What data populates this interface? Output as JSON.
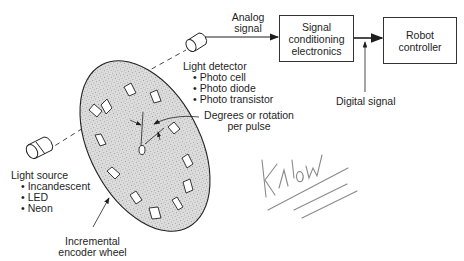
{
  "diagram": {
    "type": "block-diagram",
    "labels": {
      "analog_signal": [
        "Analog",
        "signal"
      ],
      "signal_box": [
        "Signal",
        "conditioning",
        "electronics"
      ],
      "robot_box": [
        "Robot",
        "controller"
      ],
      "digital_signal": "Digital signal",
      "light_detector": {
        "title": "Light detector",
        "items": [
          "Photo cell",
          "Photo diode",
          "Photo transistor"
        ]
      },
      "degrees": [
        "Degrees or rotation",
        "per pulse"
      ],
      "light_source": {
        "title": "Light source",
        "items": [
          "Incandescent",
          "LED",
          "Neon"
        ]
      },
      "wheel": [
        "Incremental",
        "encoder wheel"
      ],
      "handwriting": "Know"
    },
    "colors": {
      "ink": "#1e1e1e",
      "wheel_fill": "#d8d8d8",
      "pencil": "#8a8a8a"
    }
  }
}
